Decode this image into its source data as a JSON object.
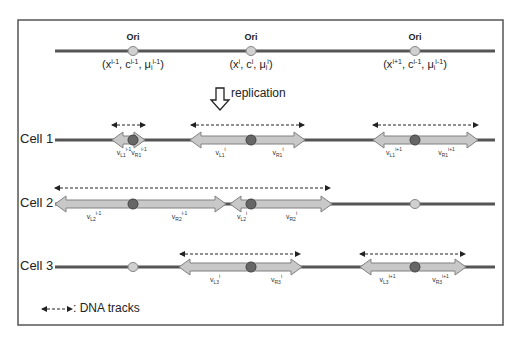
{
  "diagram": {
    "frame": {
      "x": 18,
      "y": 20,
      "width": 485,
      "height": 305
    },
    "colors": {
      "dna_line": "#555555",
      "fork_arrow_fill": "#c8c8c8",
      "fork_arrow_stroke": "#808080",
      "fired_origin": "#666666",
      "unfired_origin": "#d0d0d0",
      "track": "#222222"
    },
    "parent": {
      "line": {
        "x1": 55,
        "x2": 495,
        "y": 51
      },
      "origins": [
        {
          "label": "Ori",
          "x": 133,
          "coord_text": "(xi-1, ci-1, μii-1)",
          "coord": {
            "x": "x",
            "x_sup": "i-1",
            "c": "c",
            "c_sup": "i-1",
            "mu": "μ",
            "mu_sub": "i",
            "mu_sup": "i-1"
          }
        },
        {
          "label": "Ori",
          "x": 251,
          "coord_text": "(xi, ci, μii)",
          "coord": {
            "x": "x",
            "x_sup": "i",
            "c": "c",
            "c_sup": "i",
            "mu": "μ",
            "mu_sub": "i",
            "mu_sup": "i"
          }
        },
        {
          "label": "Ori",
          "x": 415,
          "coord_text": "(xi+1, ci-1, μii-1)",
          "coord": {
            "x": "x",
            "x_sup": "i+1",
            "c": "c",
            "c_sup": "i-1",
            "mu": "μ",
            "mu_sub": "i",
            "mu_sup": "i-1"
          }
        }
      ]
    },
    "replication_label": "replication",
    "cells": [
      {
        "label": "Cell 1",
        "y": 140,
        "line_x1": 55,
        "line_x2": 495,
        "forks": [
          {
            "origin_x": 133,
            "left_end": 112,
            "right_end": 145,
            "fired": true,
            "left_label": {
              "v": "v",
              "sub": "L1",
              "sup": "i-1"
            },
            "right_label": {
              "v": "v",
              "sub": "R1",
              "sup": "i-1"
            },
            "track": {
              "x1": 112,
              "x2": 145,
              "y": 125
            }
          },
          {
            "origin_x": 251,
            "left_end": 190,
            "right_end": 305,
            "fired": true,
            "left_label": {
              "v": "v",
              "sub": "L1",
              "sup": "i"
            },
            "right_label": {
              "v": "v",
              "sub": "R1",
              "sup": "i"
            },
            "track": {
              "x1": 191,
              "x2": 304,
              "y": 125
            }
          },
          {
            "origin_x": 415,
            "left_end": 373,
            "right_end": 478,
            "fired": true,
            "left_label": {
              "v": "v",
              "sub": "L1",
              "sup": "i+1"
            },
            "right_label": {
              "v": "v",
              "sub": "R1",
              "sup": "i+1"
            },
            "track": {
              "x1": 373,
              "x2": 478,
              "y": 125
            }
          }
        ]
      },
      {
        "label": "Cell 2",
        "y": 204,
        "line_x1": 55,
        "line_x2": 495,
        "forks": [
          {
            "origin_x": 133,
            "left_end": 55,
            "right_end": 226,
            "fired": true,
            "left_label": {
              "v": "v",
              "sub": "L2",
              "sup": "i-1"
            },
            "right_label": {
              "v": "v",
              "sub": "R2",
              "sup": "i-1"
            },
            "track": null
          },
          {
            "origin_x": 251,
            "left_end": 230,
            "right_end": 332,
            "fired": true,
            "left_label": {
              "v": "v",
              "sub": "L2",
              "sup": "i"
            },
            "right_label": {
              "v": "v",
              "sub": "R2",
              "sup": "i"
            },
            "track": null
          }
        ],
        "merged_track": {
          "x1": 55,
          "x2": 330,
          "y": 188
        },
        "unfired_origins": [
          415
        ]
      },
      {
        "label": "Cell 3",
        "y": 267,
        "line_x1": 55,
        "line_x2": 495,
        "unfired_origins": [
          133
        ],
        "forks": [
          {
            "origin_x": 251,
            "left_end": 179,
            "right_end": 302,
            "fired": true,
            "left_label": {
              "v": "v",
              "sub": "L3",
              "sup": "i"
            },
            "right_label": {
              "v": "v",
              "sub": "R3",
              "sup": "i"
            },
            "track": {
              "x1": 180,
              "x2": 300,
              "y": 254
            }
          },
          {
            "origin_x": 415,
            "left_end": 360,
            "right_end": 466,
            "fired": true,
            "left_label": {
              "v": "v",
              "sub": "L3",
              "sup": "i+1"
            },
            "right_label": {
              "v": "v",
              "sub": "R3",
              "sup": "i+1"
            },
            "track": {
              "x1": 360,
              "x2": 465,
              "y": 254
            }
          }
        ]
      }
    ],
    "legend": {
      "label": ": DNA tracks",
      "icon": "dashed-double-arrow"
    }
  }
}
